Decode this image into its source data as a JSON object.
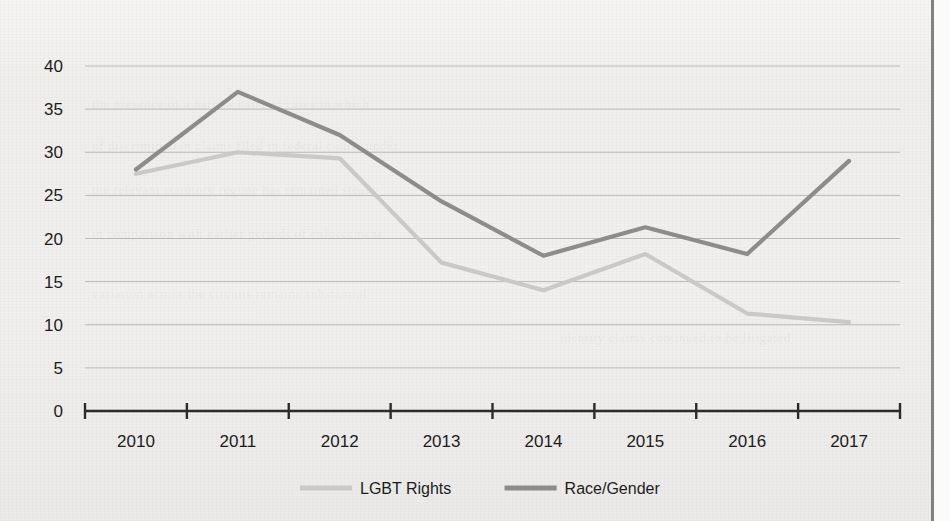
{
  "chart_data": {
    "type": "line",
    "title": "",
    "subtitle": "",
    "xlabel": "",
    "ylabel": "",
    "categories": [
      "2010",
      "2011",
      "2012",
      "2013",
      "2014",
      "2015",
      "2016",
      "2017"
    ],
    "series": [
      {
        "name": "LGBT Rights",
        "color": "#c9c9c9",
        "values": [
          27.5,
          30.0,
          29.3,
          17.2,
          14.0,
          18.2,
          11.3,
          10.3
        ]
      },
      {
        "name": "Race/Gender",
        "color": "#8c8c8c",
        "values": [
          28.0,
          37.0,
          32.0,
          24.3,
          18.0,
          21.3,
          18.2,
          29.0
        ]
      }
    ],
    "ylim": [
      0,
      40
    ],
    "yticks": [
      0,
      5,
      10,
      15,
      20,
      25,
      30,
      35,
      40
    ],
    "ytick_labels": [
      "0",
      "5",
      "10",
      "15",
      "20",
      "25",
      "30",
      "35",
      "40"
    ],
    "grid": true,
    "grid_axis": "y",
    "legend_position": "bottom",
    "axis_color": "#2b2b2b",
    "grid_color": "#b9b9b9",
    "background_color": "#f2f1ef"
  },
  "legend": {
    "items": [
      {
        "label": "LGBT Rights",
        "color": "#c9c9c9"
      },
      {
        "label": "Race/Gender",
        "color": "#8c8c8c"
      }
    ]
  },
  "page": {
    "ghost_lines": [
      "the presence of a narrow band of cases in which",
      "of discrimination claims filed in federal courts under",
      "the relevant statutory regime has remained steady",
      "in comparison with earlier periods of enforcement",
      "variation across the circuits remains substantial",
      "identity claims continued to be litigated"
    ]
  }
}
